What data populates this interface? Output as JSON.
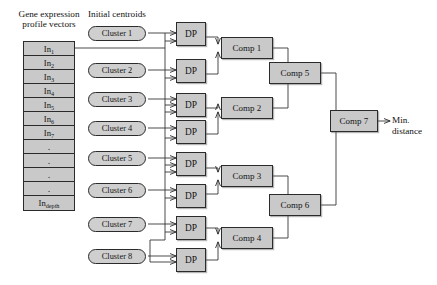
{
  "diagram": {
    "labels": {
      "gene_vectors": "Gene expression\nprofile vectors",
      "initial_centroids": "Initial centroids",
      "min_distance": "Min.\ndistance"
    },
    "input_vectors": {
      "name": "gene-expression-profile-vector-stack",
      "rows": [
        {
          "text": "In",
          "sub": "1",
          "type": "vector"
        },
        {
          "text": "In",
          "sub": "2",
          "type": "vector"
        },
        {
          "text": "In",
          "sub": "3",
          "type": "vector"
        },
        {
          "text": "In",
          "sub": "4",
          "type": "vector"
        },
        {
          "text": "In",
          "sub": "5",
          "type": "vector"
        },
        {
          "text": "In",
          "sub": "6",
          "type": "vector"
        },
        {
          "text": "In",
          "sub": "7",
          "type": "vector"
        },
        {
          "text": ".",
          "sub": "",
          "type": "ellipsis"
        },
        {
          "text": ".",
          "sub": "",
          "type": "ellipsis"
        },
        {
          "text": ".",
          "sub": "",
          "type": "ellipsis"
        },
        {
          "text": ".",
          "sub": "",
          "type": "ellipsis"
        },
        {
          "text": "In",
          "sub": "depth",
          "type": "vector"
        }
      ]
    },
    "clusters": [
      {
        "label": "Cluster 1"
      },
      {
        "label": "Cluster 2"
      },
      {
        "label": "Cluster 3"
      },
      {
        "label": "Cluster 4"
      },
      {
        "label": "Cluster 5"
      },
      {
        "label": "Cluster 6"
      },
      {
        "label": "Cluster 7"
      },
      {
        "label": "Cluster 8"
      }
    ],
    "dp_units": [
      {
        "label": "DP"
      },
      {
        "label": "DP"
      },
      {
        "label": "DP"
      },
      {
        "label": "DP"
      },
      {
        "label": "DP"
      },
      {
        "label": "DP"
      },
      {
        "label": "DP"
      },
      {
        "label": "DP"
      }
    ],
    "comparators": [
      {
        "label": "Comp 1",
        "stage": 1
      },
      {
        "label": "Comp 2",
        "stage": 1
      },
      {
        "label": "Comp 3",
        "stage": 1
      },
      {
        "label": "Comp 4",
        "stage": 1
      },
      {
        "label": "Comp 5",
        "stage": 2
      },
      {
        "label": "Comp 6",
        "stage": 2
      },
      {
        "label": "Comp 7",
        "stage": 3
      }
    ],
    "colors": {
      "box_fill": "#c9c9c9",
      "pill_fill": "#cfcfcf",
      "stroke": "#2b2b2b",
      "background": "#ffffff",
      "text": "#141414"
    }
  }
}
